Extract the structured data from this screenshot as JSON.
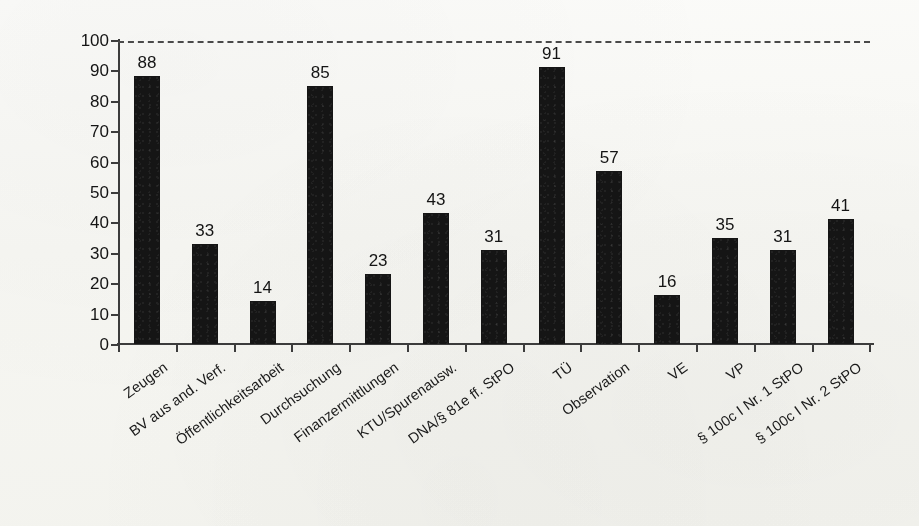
{
  "chart_data": {
    "type": "bar",
    "title": "",
    "subtitle": "",
    "xlabel": "",
    "ylabel": "Anzahl Verfahren",
    "ylim": [
      0,
      100
    ],
    "yticks": [
      0,
      10,
      20,
      30,
      40,
      50,
      60,
      70,
      80,
      90,
      100
    ],
    "grid": false,
    "legend": null,
    "bar_color": "#151515",
    "axis_color": "#3c3c3c",
    "background_color": "#fbfbf9",
    "annotations": [
      {
        "name": "reference-line",
        "type": "dashed-horizontal-line",
        "value": 100,
        "color": "#4a4a4a"
      }
    ],
    "categories": [
      "Zeugen",
      "BV aus and. Verf.",
      "Öffentlichkeitsarbeit",
      "Durchsuchung",
      "Finanzermittlungen",
      "KTU/Spurenausw.",
      "DNA/§ 81e ff. StPO",
      "TÜ",
      "Observation",
      "VE",
      "VP",
      "§ 100c I Nr. 1 StPO",
      "§ 100c I Nr. 2 StPO"
    ],
    "values": [
      88,
      33,
      14,
      85,
      23,
      43,
      31,
      91,
      57,
      16,
      35,
      31,
      41
    ],
    "data_labels": [
      "88",
      "33",
      "14",
      "85",
      "23",
      "43",
      "31",
      "91",
      "57",
      "16",
      "35",
      "31",
      "41"
    ]
  }
}
